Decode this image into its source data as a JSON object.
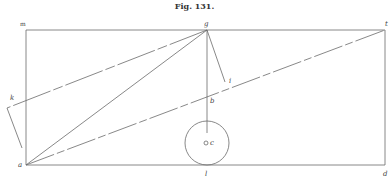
{
  "figure": {
    "caption": "Fig. 131.",
    "labels": {
      "m": "m",
      "g": "g",
      "t": "t",
      "k": "k",
      "i": "i",
      "b": "b",
      "c": "c",
      "a": "a",
      "d": "d",
      "l": "l"
    },
    "colors": {
      "line": "#6a6a6a",
      "text": "#444444"
    }
  }
}
